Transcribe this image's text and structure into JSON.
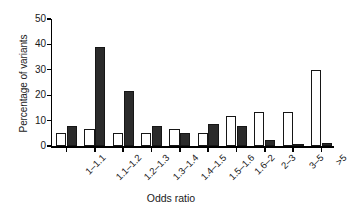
{
  "chart_data": {
    "type": "bar",
    "title": "",
    "subtitle": "",
    "xlabel": "Odds ratio",
    "ylabel": "Percentage of variants",
    "categories": [
      "1–1.1",
      "1.1–1.2",
      "1.2–1.3",
      "1.3–1.4",
      "1.4–1.5",
      "1.5–1.6",
      "1.6–2",
      "2–3",
      "3–5",
      ">5"
    ],
    "series": [
      {
        "name": "open",
        "fill": "#ffffff",
        "stroke": "#161616",
        "values": [
          5.0,
          6.7,
          5.0,
          5.0,
          6.7,
          5.0,
          11.8,
          13.5,
          13.5,
          30.0
        ]
      },
      {
        "name": "filled",
        "fill": "#2b2b2b",
        "stroke": "#161616",
        "values": [
          7.9,
          38.9,
          21.5,
          8.0,
          5.3,
          8.5,
          8.0,
          2.2,
          0.8,
          1.3
        ]
      }
    ],
    "ylim": [
      0,
      50
    ],
    "yticks": [
      0,
      10,
      20,
      30,
      40,
      50
    ],
    "ytick_labels": [
      "0",
      "10",
      "20",
      "30",
      "40",
      "50"
    ],
    "grid": false,
    "legend": "none",
    "axis_color": "#000000",
    "background": "#ffffff"
  }
}
